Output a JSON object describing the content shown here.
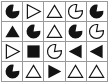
{
  "figure": {
    "title": "",
    "type": "shape-grid",
    "rows": 4,
    "cols": 5,
    "background_color": "#ffffff",
    "grid_line_color": "#9a9a9a",
    "shape_fill_color": "#141414",
    "shape_outline_color": "#141414",
    "shape_vocabulary": [
      "pacman",
      "triangle",
      "square"
    ],
    "style_vocabulary": [
      "filled",
      "outline"
    ],
    "orientation_vocabulary": [
      "up",
      "right",
      "left",
      "upper-right"
    ],
    "cells": [
      {
        "row": 1,
        "col": 1,
        "name": "pacman",
        "style": "filled",
        "orientation": "upper-right",
        "label": "filled-pacman"
      },
      {
        "row": 1,
        "col": 2,
        "name": "triangle",
        "style": "outline",
        "orientation": "right",
        "label": "outline-right-triangle"
      },
      {
        "row": 1,
        "col": 3,
        "name": "triangle",
        "style": "outline",
        "orientation": "up",
        "label": "outline-up-triangle"
      },
      {
        "row": 1,
        "col": 4,
        "name": "pacman",
        "style": "outline",
        "orientation": "upper-right",
        "label": "outline-pacman"
      },
      {
        "row": 1,
        "col": 5,
        "name": "pacman",
        "style": "filled",
        "orientation": "upper-right",
        "label": "filled-pacman"
      },
      {
        "row": 2,
        "col": 1,
        "name": "triangle",
        "style": "filled",
        "orientation": "up",
        "label": "filled-up-triangle"
      },
      {
        "row": 2,
        "col": 2,
        "name": "pacman",
        "style": "filled",
        "orientation": "upper-right",
        "label": "filled-pacman"
      },
      {
        "row": 2,
        "col": 3,
        "name": "triangle",
        "style": "outline",
        "orientation": "up",
        "label": "outline-up-triangle"
      },
      {
        "row": 2,
        "col": 4,
        "name": "pacman",
        "style": "filled",
        "orientation": "upper-right",
        "label": "filled-pacman"
      },
      {
        "row": 2,
        "col": 5,
        "name": "pacman",
        "style": "outline",
        "orientation": "upper-right",
        "label": "outline-pacman"
      },
      {
        "row": 3,
        "col": 1,
        "name": "triangle",
        "style": "outline",
        "orientation": "right",
        "label": "outline-right-triangle"
      },
      {
        "row": 3,
        "col": 2,
        "name": "square",
        "style": "filled",
        "orientation": "up",
        "label": "filled-square"
      },
      {
        "row": 3,
        "col": 3,
        "name": "pacman",
        "style": "outline",
        "orientation": "upper-right",
        "label": "outline-pacman"
      },
      {
        "row": 3,
        "col": 4,
        "name": "triangle",
        "style": "filled",
        "orientation": "left",
        "label": "filled-left-triangle"
      },
      {
        "row": 3,
        "col": 5,
        "name": "triangle",
        "style": "filled",
        "orientation": "left",
        "label": "filled-left-triangle"
      },
      {
        "row": 4,
        "col": 1,
        "name": "pacman",
        "style": "filled",
        "orientation": "upper-right",
        "label": "filled-pacman"
      },
      {
        "row": 4,
        "col": 2,
        "name": "triangle",
        "style": "outline",
        "orientation": "up",
        "label": "outline-up-triangle"
      },
      {
        "row": 4,
        "col": 3,
        "name": "triangle",
        "style": "filled",
        "orientation": "right",
        "label": "filled-right-triangle"
      },
      {
        "row": 4,
        "col": 4,
        "name": "triangle",
        "style": "outline",
        "orientation": "up",
        "label": "outline-up-triangle"
      },
      {
        "row": 4,
        "col": 5,
        "name": "triangle",
        "style": "outline",
        "orientation": "up",
        "label": "outline-up-triangle"
      }
    ]
  }
}
